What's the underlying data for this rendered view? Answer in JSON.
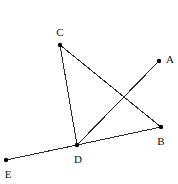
{
  "figure": {
    "width": 178,
    "height": 184,
    "background_color": "#ffffff",
    "stroke_color": "#2b2b2b",
    "point_color": "#000000",
    "label_color": "#111111"
  },
  "chart_data": {
    "type": "scatter",
    "title": "",
    "xlabel": "",
    "ylabel": "",
    "xlim": [
      0,
      178
    ],
    "ylim": [
      184,
      0
    ],
    "grid": false,
    "legend": "none",
    "points": [
      {
        "name": "A",
        "x": 159,
        "y": 61,
        "label": "A",
        "label_x": 170,
        "label_y": 59
      },
      {
        "name": "B",
        "x": 161,
        "y": 127,
        "label": "B",
        "label_x": 161,
        "label_y": 141
      },
      {
        "name": "C",
        "x": 60,
        "y": 45,
        "label": "C",
        "label_x": 60,
        "label_y": 32
      },
      {
        "name": "D",
        "x": 77,
        "y": 145,
        "label": "D",
        "label_x": 78,
        "label_y": 159
      },
      {
        "name": "E",
        "x": 6,
        "y": 160,
        "label": "E",
        "label_x": 8,
        "label_y": 174
      }
    ],
    "segments": [
      {
        "name": "segment-CD",
        "from": "C",
        "to": "D",
        "x1": 60,
        "y1": 45,
        "x2": 77,
        "y2": 145
      },
      {
        "name": "segment-CB",
        "from": "C",
        "to": "B",
        "x1": 60,
        "y1": 45,
        "x2": 161,
        "y2": 127
      },
      {
        "name": "segment-DA",
        "from": "D",
        "to": "A",
        "x1": 77,
        "y1": 145,
        "x2": 159,
        "y2": 61
      },
      {
        "name": "segment-DB",
        "from": "D",
        "to": "B",
        "x1": 77,
        "y1": 145,
        "x2": 161,
        "y2": 127
      },
      {
        "name": "segment-ED",
        "from": "E",
        "to": "D",
        "x1": 6,
        "y1": 160,
        "x2": 77,
        "y2": 145
      }
    ]
  }
}
